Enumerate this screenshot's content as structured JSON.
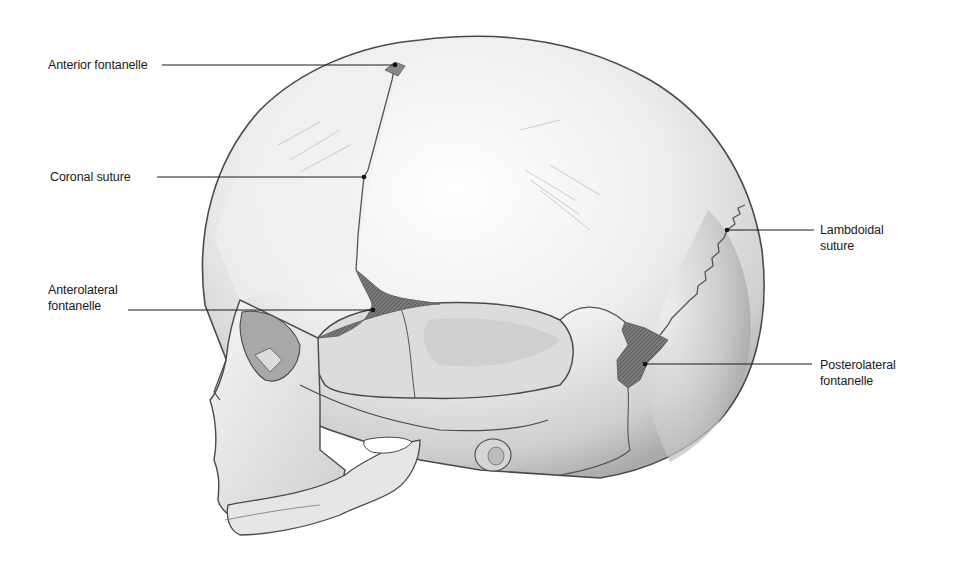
{
  "figure": {
    "colors": {
      "bone_light": "#f4f4f4",
      "bone_shade": "#bdbdbd",
      "outline": "#4a4a4a",
      "fontanelle": "#6e6e6e",
      "leader_line": "#1a1a1a"
    }
  },
  "labels": [
    {
      "id": "anterior-fontanelle",
      "text": "Anterior fontanelle",
      "x": 48,
      "y": 56,
      "line_x1": 162,
      "line_x2": 395,
      "line_y": 65
    },
    {
      "id": "coronal-suture",
      "text": "Coronal suture",
      "x": 50,
      "y": 169,
      "line_x1": 157,
      "line_x2": 364,
      "line_y": 177
    },
    {
      "id": "anterolateral-fontanelle",
      "text1": "Anterolateral",
      "text2": "fontanelle",
      "x": 48,
      "y": 282,
      "line_x1": 128,
      "line_x2": 373,
      "line_y": 310
    },
    {
      "id": "lambdoidal-suture",
      "text1": "Lambdoidal",
      "text2": "suture",
      "x": 820,
      "y": 222,
      "line_x1": 727,
      "line_x2": 814,
      "line_y": 230
    },
    {
      "id": "posterolateral-fontanelle",
      "text1": "Posterolateral",
      "text2": "fontanelle",
      "x": 820,
      "y": 358,
      "line_x1": 645,
      "line_x2": 812,
      "line_y": 364
    }
  ]
}
